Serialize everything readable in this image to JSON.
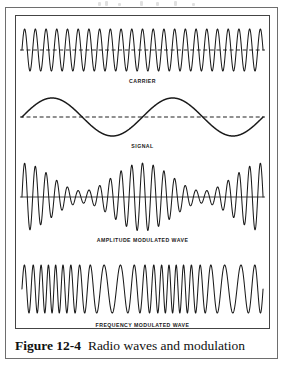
{
  "figure": {
    "caption_number": "Figure 12-4",
    "caption_title": "Radio waves and modulation",
    "border_color": "#6e6e6e",
    "panel_border_color": "#444444",
    "stroke_color": "#1a1a1a",
    "background_color": "#ffffff"
  },
  "panel": {
    "width": 255,
    "height": 314,
    "waves": [
      {
        "id": "carrier",
        "label": "CARRIER",
        "type": "carrier",
        "top": 6,
        "svg_height": 56,
        "label_top": 62,
        "cycles": 22.5,
        "amplitude": 21,
        "centerline": "dashed",
        "centerline_color": "#333333",
        "stroke_width": 1.05,
        "description": "Constant-amplitude, constant-frequency high-frequency sine wave"
      },
      {
        "id": "signal",
        "label": "SIGNAL",
        "type": "signal",
        "top": 76,
        "svg_height": 50,
        "label_top": 127,
        "cycles": 2,
        "amplitude": 19,
        "centerline": "dashed",
        "centerline_color": "#222222",
        "stroke_width": 1.5,
        "description": "Low-frequency modulating sine wave, two cycles"
      },
      {
        "id": "amplitude-modulated-wave",
        "label": "AMPLITUDE MODULATED WAVE",
        "type": "am",
        "top": 142,
        "svg_height": 78,
        "label_top": 221,
        "cycles": 22.5,
        "amplitude": 34,
        "modulation_cycles": 2,
        "modulation_depth": 0.82,
        "centerline": "solid",
        "centerline_color": "#333333",
        "stroke_width": 1.05,
        "description": "Carrier whose envelope follows the signal amplitude"
      },
      {
        "id": "frequency-modulated-wave",
        "label": "FREQUENCY MODULATED WAVE",
        "type": "fm",
        "top": 240,
        "svg_height": 66,
        "label_top": 306,
        "cycles": 24,
        "amplitude": 24,
        "modulation_cycles": 2,
        "deviation": 9.5,
        "centerline": "none",
        "centerline_color": "#333333",
        "stroke_width": 1.05,
        "description": "Constant-amplitude carrier whose frequency follows the signal"
      }
    ]
  },
  "chart_data": {
    "type": "line",
    "title": "Radio waves and modulation",
    "xlabel": "",
    "ylabel": "",
    "grid": false,
    "legend_position": "below-each-trace",
    "series": [
      {
        "name": "CARRIER",
        "waveform": "sine",
        "cycles": 22.5,
        "relative_amplitude": 1.0,
        "amplitude_constant": true,
        "frequency_constant": true
      },
      {
        "name": "SIGNAL",
        "waveform": "sine",
        "cycles": 2,
        "relative_amplitude": 1.0,
        "amplitude_constant": true,
        "frequency_constant": true
      },
      {
        "name": "AMPLITUDE MODULATED WAVE",
        "waveform": "amplitude-modulated-sine",
        "carrier_cycles": 22.5,
        "modulation_cycles": 2,
        "modulation_depth": 0.82,
        "amplitude_constant": false,
        "frequency_constant": true
      },
      {
        "name": "FREQUENCY MODULATED WAVE",
        "waveform": "frequency-modulated-sine",
        "carrier_cycles": 24,
        "modulation_cycles": 2,
        "frequency_deviation": 9.5,
        "amplitude_constant": true,
        "frequency_constant": false
      }
    ]
  }
}
